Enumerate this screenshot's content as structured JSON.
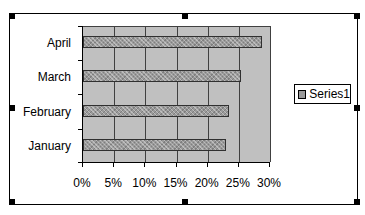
{
  "chart_data": {
    "type": "bar",
    "orientation": "horizontal",
    "title": "",
    "xlabel": "",
    "ylabel": "",
    "categories": [
      "January",
      "February",
      "March",
      "April"
    ],
    "series": [
      {
        "name": "Series1",
        "values": [
          0.23,
          0.235,
          0.254,
          0.287
        ]
      }
    ],
    "xlim": [
      0,
      0.3
    ],
    "x_tick_labels": [
      "0%",
      "5%",
      "10%",
      "15%",
      "20%",
      "25%",
      "30%"
    ],
    "grid": {
      "vertical": true,
      "horizontal": false
    },
    "legend": {
      "position": "right",
      "entries": [
        "Series1"
      ]
    },
    "plot_background": "#c0c0c0",
    "bar_pattern": "gray dotted"
  },
  "labels": {
    "categories_top_to_bottom": [
      "April",
      "March",
      "February",
      "January"
    ],
    "legend_label": "Series1",
    "xticks": [
      "0%",
      "5%",
      "10%",
      "15%",
      "20%",
      "25%",
      "30%"
    ]
  }
}
